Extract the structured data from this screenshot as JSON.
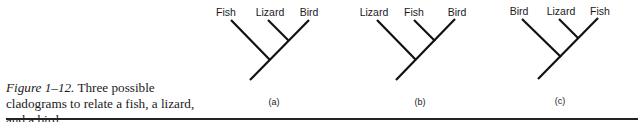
{
  "caption": {
    "figure_label": "Figure 1–12.",
    "text": "Three possible cladograms to relate a fish, a lizard, and a bird."
  },
  "cladograms": [
    {
      "id": "a",
      "sublabel": "(a)",
      "taxa": [
        "Fish",
        "Lizard",
        "Bird"
      ],
      "offset_x": 0
    },
    {
      "id": "b",
      "sublabel": "(b)",
      "taxa": [
        "Lizard",
        "Fish",
        "Bird"
      ],
      "offset_x": 136
    },
    {
      "id": "c",
      "sublabel": "(c)",
      "taxa": [
        "Bird",
        "Lizard",
        "Fish"
      ],
      "offset_x": 260
    }
  ]
}
